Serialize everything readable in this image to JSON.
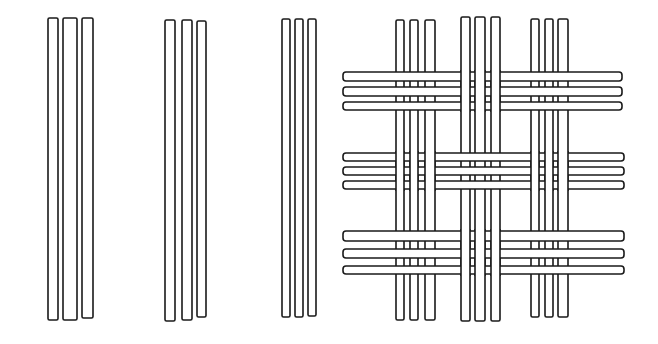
{
  "diagram": {
    "title": "",
    "colors": {
      "stroke": "#1a1a1a",
      "fill": "#ffffff",
      "background": "#ffffff"
    },
    "loose_warp_groups": [
      {
        "strips": [
          {
            "x": 48,
            "w": 10,
            "y": 18,
            "h": 302
          },
          {
            "x": 63,
            "w": 14,
            "y": 18,
            "h": 302
          },
          {
            "x": 82,
            "w": 11,
            "y": 18,
            "h": 300
          }
        ]
      },
      {
        "strips": [
          {
            "x": 165,
            "w": 10,
            "y": 20,
            "h": 301
          },
          {
            "x": 182,
            "w": 10,
            "y": 20,
            "h": 300
          },
          {
            "x": 197,
            "w": 9,
            "y": 21,
            "h": 296
          }
        ]
      },
      {
        "strips": [
          {
            "x": 282,
            "w": 8,
            "y": 19,
            "h": 298
          },
          {
            "x": 295,
            "w": 8,
            "y": 19,
            "h": 298
          },
          {
            "x": 308,
            "w": 8,
            "y": 19,
            "h": 297
          }
        ]
      }
    ],
    "woven_panel": {
      "warp_groups": [
        {
          "strips": [
            {
              "x": 396,
              "w": 8
            },
            {
              "x": 410,
              "w": 8
            },
            {
              "x": 425,
              "w": 10
            }
          ],
          "y": 20,
          "h": 300
        },
        {
          "strips": [
            {
              "x": 461,
              "w": 9
            },
            {
              "x": 475,
              "w": 10
            },
            {
              "x": 491,
              "w": 9
            }
          ],
          "y": 17,
          "h": 304
        },
        {
          "strips": [
            {
              "x": 531,
              "w": 8
            },
            {
              "x": 545,
              "w": 8
            },
            {
              "x": 558,
              "w": 10
            }
          ],
          "y": 19,
          "h": 298
        }
      ],
      "weft_rows": [
        {
          "strips": [
            {
              "y": 72,
              "h": 9
            },
            {
              "y": 87,
              "h": 9
            },
            {
              "y": 102,
              "h": 8
            }
          ],
          "x": 343,
          "w": 279,
          "over_groups": [
            0,
            2
          ]
        },
        {
          "strips": [
            {
              "y": 153,
              "h": 8
            },
            {
              "y": 167,
              "h": 8
            },
            {
              "y": 181,
              "h": 8
            }
          ],
          "x": 343,
          "w": 281,
          "over_groups": [
            1
          ]
        },
        {
          "strips": [
            {
              "y": 231,
              "h": 10
            },
            {
              "y": 249,
              "h": 9
            },
            {
              "y": 266,
              "h": 8
            }
          ],
          "x": 343,
          "w": 281,
          "over_groups": [
            0,
            2
          ]
        }
      ]
    }
  }
}
